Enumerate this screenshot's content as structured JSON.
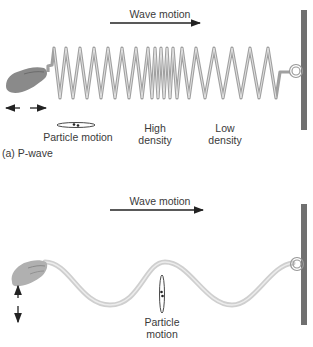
{
  "panel_a": {
    "title": "(a) P-wave",
    "wave_motion_label": "Wave motion",
    "particle_motion_label": "Particle motion",
    "high_density_label_line1": "High",
    "high_density_label_line2": "density",
    "low_density_label_line1": "Low",
    "low_density_label_line2": "density"
  },
  "panel_b": {
    "wave_motion_label": "Wave motion",
    "particle_motion_label_line1": "Particle",
    "particle_motion_label_line2": "motion"
  },
  "colors": {
    "wall": "#707070",
    "spring": "#a9a9a9",
    "rope": "#d8d8d8",
    "hand": "#8a8a8a",
    "arrow": "#222222"
  }
}
